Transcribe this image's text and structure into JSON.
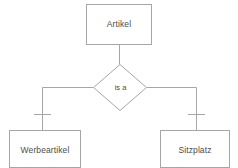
{
  "diagram": {
    "type": "er-diagram",
    "notation": "chen-is-a-specialization",
    "stroke_color": "#a6a6a6",
    "text_color": "#4c4c4c",
    "background_color": "#ffffff",
    "entities": [
      {
        "id": "artikel",
        "label": "Artikel",
        "shape": "rectangle",
        "role": "superclass",
        "x": 86,
        "y": 4,
        "width": 66,
        "height": 41
      },
      {
        "id": "werbeartikel",
        "label": "Werbeartikel",
        "shape": "rectangle",
        "role": "subclass",
        "x": 9,
        "y": 130,
        "width": 72,
        "height": 38
      },
      {
        "id": "sitzplatz",
        "label": "Sitzplatz",
        "shape": "rectangle",
        "role": "subclass",
        "x": 160,
        "y": 130,
        "width": 70,
        "height": 38
      }
    ],
    "relationships": [
      {
        "id": "is-a",
        "label": "is a",
        "shape": "diamond",
        "cx": 120,
        "cy": 87,
        "rx": 27,
        "ry": 23
      }
    ],
    "connectors": [
      {
        "id": "artikel-to-isa",
        "from": "artikel",
        "to": "is-a",
        "style": "plain"
      },
      {
        "id": "isa-to-werbeartikel",
        "from": "is-a",
        "to": "werbeartikel",
        "style": "tick-mark"
      },
      {
        "id": "isa-to-sitzplatz",
        "from": "is-a",
        "to": "sitzplatz",
        "style": "tick-mark"
      }
    ]
  }
}
